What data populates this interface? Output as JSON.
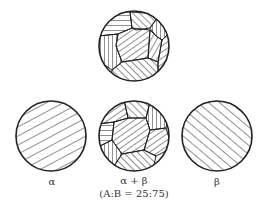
{
  "diagram": {
    "type": "microstructure-schematic",
    "stroke_color": "#222222",
    "background": "#ffffff",
    "circles": [
      {
        "id": "top-mixed",
        "description": "polycrystalline grains with mixed hatching orientations",
        "label": ""
      },
      {
        "id": "alpha",
        "description": "uniform hatching, shallow diagonal (lower-left to upper-right)",
        "label": "α"
      },
      {
        "id": "alpha-beta",
        "description": "mixed grain structure",
        "label": "α + β",
        "sublabel": "(A:B = 25:75)"
      },
      {
        "id": "beta",
        "description": "uniform hatching, steep diagonal (upper-left to lower-right)",
        "label": "β"
      }
    ]
  }
}
